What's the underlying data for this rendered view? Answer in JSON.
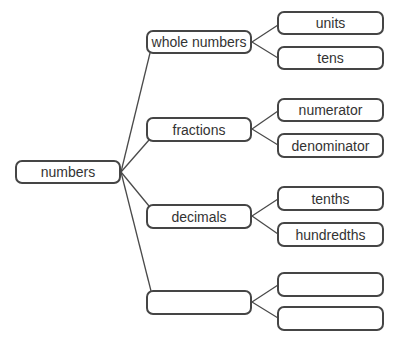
{
  "diagram": {
    "type": "tree",
    "root": {
      "label": "numbers",
      "box": {
        "x": 15,
        "y": 160,
        "w": 106,
        "h": 24
      }
    },
    "branches": [
      {
        "label": "whole numbers",
        "box": {
          "x": 146,
          "y": 30,
          "w": 106,
          "h": 24
        },
        "children": [
          {
            "label": "units",
            "box": {
              "x": 277,
              "y": 11,
              "w": 107,
              "h": 24
            }
          },
          {
            "label": "tens",
            "box": {
              "x": 277,
              "y": 46,
              "w": 107,
              "h": 24
            }
          }
        ]
      },
      {
        "label": "fractions",
        "box": {
          "x": 146,
          "y": 117,
          "w": 106,
          "h": 25
        },
        "children": [
          {
            "label": "numerator",
            "box": {
              "x": 277,
              "y": 98,
              "w": 107,
              "h": 24
            }
          },
          {
            "label": "denominator",
            "box": {
              "x": 277,
              "y": 133,
              "w": 107,
              "h": 25
            }
          }
        ]
      },
      {
        "label": "decimals",
        "box": {
          "x": 146,
          "y": 204,
          "w": 106,
          "h": 25
        },
        "children": [
          {
            "label": "tenths",
            "box": {
              "x": 277,
              "y": 186,
              "w": 107,
              "h": 25
            }
          },
          {
            "label": "hundredths",
            "box": {
              "x": 277,
              "y": 222,
              "w": 107,
              "h": 25
            }
          }
        ]
      },
      {
        "label": "",
        "box": {
          "x": 146,
          "y": 290,
          "w": 106,
          "h": 25
        },
        "children": [
          {
            "label": "",
            "box": {
              "x": 277,
              "y": 272,
              "w": 107,
              "h": 25
            }
          },
          {
            "label": "",
            "box": {
              "x": 277,
              "y": 306,
              "w": 107,
              "h": 25
            }
          }
        ]
      }
    ],
    "colors": {
      "border": "#454545",
      "line": "#4a4a4a",
      "text": "#333333",
      "background": "#ffffff"
    }
  }
}
